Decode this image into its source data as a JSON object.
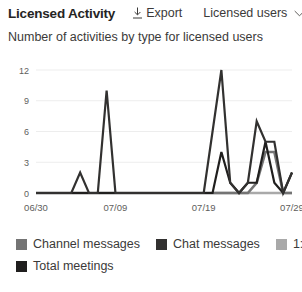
{
  "header": {
    "title": "Licensed Activity",
    "export_label": "Export",
    "export_icon": "download-icon",
    "filter_value": "Licensed users",
    "filter_icon": "chevron-down-icon"
  },
  "subtitle": "Number of activities by type for licensed users",
  "colors": {
    "channel_messages": "#747474",
    "chat_messages": "#323130",
    "one_on_one_calls": "#a9a9a9",
    "total_meetings": "#201f1e",
    "gridline": "#ededed",
    "axis_text": "#605e5c"
  },
  "legend": {
    "items": [
      {
        "label": "Channel messages",
        "color": "#747474"
      },
      {
        "label": "Chat messages",
        "color": "#323130"
      },
      {
        "label": "1:1 calls",
        "color": "#a9a9a9"
      },
      {
        "label": "Total meetings",
        "color": "#201f1e"
      }
    ]
  },
  "chart_data": {
    "type": "line",
    "title": "Number of activities by type for licensed users",
    "xlabel": "",
    "ylabel": "",
    "ylim": [
      0,
      12
    ],
    "yticks": [
      0,
      3,
      6,
      9,
      12
    ],
    "ytick_labels": [
      "0",
      "3",
      "6",
      "9",
      "12"
    ],
    "grid": true,
    "legend_position": "bottom",
    "xtick_labels": [
      "06/30",
      "07/09",
      "07/19",
      "07/29"
    ],
    "xtick_positions": [
      0,
      9,
      19,
      29
    ],
    "x": [
      0,
      1,
      2,
      3,
      4,
      5,
      6,
      7,
      8,
      9,
      10,
      11,
      12,
      13,
      14,
      15,
      16,
      17,
      18,
      19,
      20,
      21,
      22,
      23,
      24,
      25,
      26,
      27,
      28,
      29
    ],
    "x_dates": [
      "06/30",
      "07/01",
      "07/02",
      "07/03",
      "07/04",
      "07/05",
      "07/06",
      "07/07",
      "07/08",
      "07/09",
      "07/10",
      "07/11",
      "07/12",
      "07/13",
      "07/14",
      "07/15",
      "07/16",
      "07/17",
      "07/18",
      "07/19",
      "07/20",
      "07/21",
      "07/22",
      "07/23",
      "07/24",
      "07/25",
      "07/26",
      "07/27",
      "07/28",
      "07/29"
    ],
    "series": [
      {
        "name": "Channel messages",
        "color": "#747474",
        "values": [
          0,
          0,
          0,
          0,
          0,
          0,
          0,
          0,
          0,
          0,
          0,
          0,
          0,
          0,
          0,
          0,
          0,
          0,
          0,
          0,
          0,
          0,
          0,
          0,
          0,
          1,
          4,
          4,
          0,
          0
        ]
      },
      {
        "name": "Chat messages",
        "color": "#323130",
        "values": [
          0,
          0,
          0,
          0,
          0,
          2,
          0,
          0,
          10,
          0,
          0,
          0,
          0,
          0,
          0,
          0,
          0,
          0,
          0,
          0,
          6,
          12,
          1,
          0,
          1,
          7,
          5,
          5,
          0,
          2
        ]
      },
      {
        "name": "1:1 calls",
        "color": "#a9a9a9",
        "values": [
          0,
          0,
          0,
          0,
          0,
          0,
          0,
          0,
          0,
          0,
          0,
          0,
          0,
          0,
          0,
          0,
          0,
          0,
          0,
          0,
          0,
          0,
          0,
          0,
          0,
          0,
          0,
          0,
          0,
          0
        ]
      },
      {
        "name": "Total meetings",
        "color": "#201f1e",
        "values": [
          0,
          0,
          0,
          0,
          0,
          0,
          0,
          0,
          0,
          0,
          0,
          0,
          0,
          0,
          0,
          0,
          0,
          0,
          0,
          0,
          0,
          4,
          1,
          0,
          1,
          1,
          5,
          1,
          0,
          2
        ]
      }
    ]
  }
}
